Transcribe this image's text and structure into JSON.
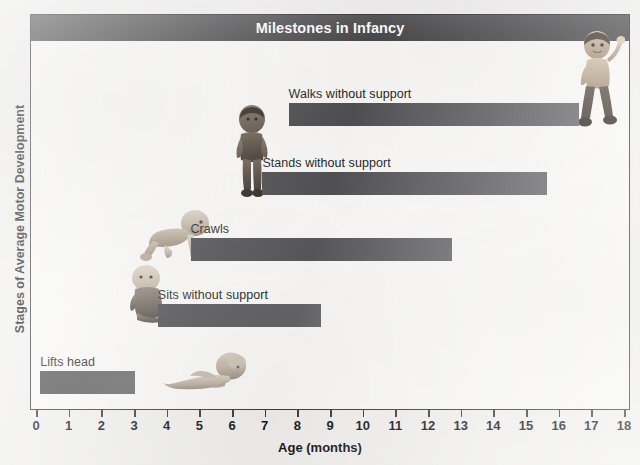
{
  "chart_data": {
    "type": "bar",
    "orientation": "horizontal",
    "title": "Milestones in Infancy",
    "xlabel": "Age (months)",
    "ylabel": "Stages of Average Motor Development",
    "xlim": [
      0,
      18
    ],
    "xticks": [
      "0",
      "1",
      "2",
      "3",
      "4",
      "5",
      "6",
      "7",
      "8",
      "9",
      "10",
      "11",
      "12",
      "13",
      "14",
      "15",
      "16",
      "17",
      "18"
    ],
    "grid": false,
    "legend": false,
    "categories": [
      "Lifts head",
      "Sits without support",
      "Crawls",
      "Stands without support",
      "Walks without support"
    ],
    "bars": [
      {
        "label": "Lifts head",
        "start": 0.1,
        "end": 3.0,
        "row": 0
      },
      {
        "label": "Sits without support",
        "start": 3.7,
        "end": 8.7,
        "row": 1
      },
      {
        "label": "Crawls",
        "start": 4.7,
        "end": 12.7,
        "row": 2
      },
      {
        "label": "Stands without support",
        "start": 6.9,
        "end": 15.6,
        "row": 3
      },
      {
        "label": "Walks without support",
        "start": 7.7,
        "end": 16.6,
        "row": 4
      }
    ],
    "colors": {
      "bar_dark": "#4a4a4d",
      "bar_light": "#6a6a6d",
      "title_banner": "#4e4e50",
      "frame": "#3b3b3d",
      "plot_background": "#fbfaf8"
    }
  },
  "figures": [
    {
      "name": "infant-lying-lifting-head",
      "row": 0
    },
    {
      "name": "infant-sitting",
      "row": 1
    },
    {
      "name": "infant-crawling",
      "row": 2
    },
    {
      "name": "toddler-standing",
      "row": 3
    },
    {
      "name": "toddler-walking",
      "row": 4
    }
  ]
}
